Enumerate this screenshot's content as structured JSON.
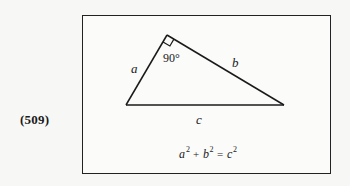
{
  "item_label": "(509)",
  "figure": {
    "shape": "right triangle",
    "right_angle_label": "90°",
    "sides": {
      "a": "a",
      "b": "b",
      "c": "c"
    },
    "equation": {
      "term1_base": "a",
      "term2_base": "b",
      "result_base": "c",
      "exponent": "2",
      "plus": "+",
      "equals": "="
    }
  }
}
